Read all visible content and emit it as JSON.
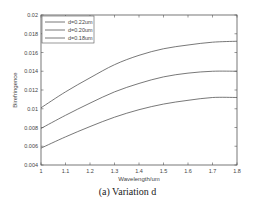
{
  "chart_data": {
    "type": "line",
    "title": "",
    "xlabel": "Wavelength/um",
    "ylabel": "Birefringence",
    "xlim": [
      1.0,
      1.8
    ],
    "ylim": [
      0.004,
      0.02
    ],
    "xticks": [
      "1",
      "1.1",
      "1.2",
      "1.3",
      "1.4",
      "1.5",
      "1.6",
      "1.7",
      "1.8"
    ],
    "yticks": [
      "0.004",
      "0.006",
      "0.008",
      "0.01",
      "0.012",
      "0.014",
      "0.016",
      "0.018",
      "0.02"
    ],
    "grid": false,
    "legend_position": "upper left",
    "x": [
      1.0,
      1.1,
      1.2,
      1.3,
      1.4,
      1.5,
      1.6,
      1.7,
      1.8
    ],
    "series": [
      {
        "name": "d=0.22um",
        "color": "#555555",
        "values": [
          0.0101,
          0.0118,
          0.0133,
          0.0147,
          0.0157,
          0.0164,
          0.0168,
          0.0171,
          0.0172
        ]
      },
      {
        "name": "d=0.20um",
        "color": "#555555",
        "values": [
          0.0079,
          0.0093,
          0.0106,
          0.0118,
          0.0127,
          0.0134,
          0.0138,
          0.014,
          0.014
        ]
      },
      {
        "name": "d=0.18um",
        "color": "#555555",
        "values": [
          0.0058,
          0.007,
          0.0081,
          0.0091,
          0.0099,
          0.0105,
          0.0109,
          0.0112,
          0.0112
        ]
      }
    ]
  },
  "caption": "(a) Variation d"
}
